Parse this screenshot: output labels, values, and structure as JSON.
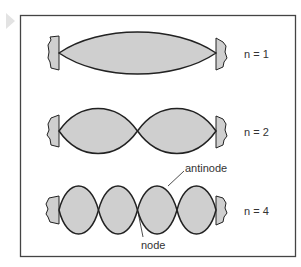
{
  "diagram": {
    "type": "standing-waves-on-string",
    "colors": {
      "fill": "#cfcfcf",
      "stroke": "#222222",
      "frame": "#444444",
      "marker": "#e3e3e3"
    },
    "rows": [
      {
        "label": "n = 1",
        "harmonic": 1
      },
      {
        "label": "n = 2",
        "harmonic": 2
      },
      {
        "label": "n = 4",
        "harmonic": 4
      }
    ],
    "annotations": {
      "antinode": "antinode",
      "node": "node"
    }
  }
}
